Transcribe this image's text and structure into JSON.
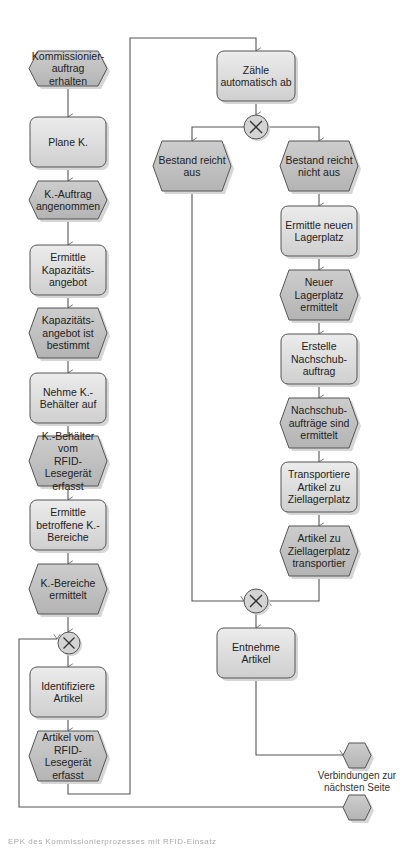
{
  "diagram": {
    "type": "EPC",
    "colors": {
      "function_fill_top": "#ececec",
      "function_fill_bottom": "#cfcfcf",
      "event_fill_top": "#cdcdcd",
      "event_fill_bottom": "#b4b4b4",
      "stroke": "#555555",
      "edge": "#555555",
      "shadow": "#d6d6d6",
      "connector_fill": "#d4d4d4"
    },
    "nodes": [
      {
        "id": "e1",
        "kind": "event",
        "label": "Kommissionier-\nauftrag erhalten",
        "x": 29,
        "y": 51,
        "w": 78,
        "h": 35
      },
      {
        "id": "f1",
        "kind": "function",
        "label": "Plane K.",
        "x": 30,
        "y": 117,
        "w": 76,
        "h": 50
      },
      {
        "id": "e2",
        "kind": "event",
        "label": "K.-Auftrag\nangenommen",
        "x": 29,
        "y": 181,
        "w": 78,
        "h": 38
      },
      {
        "id": "f2",
        "kind": "function",
        "label": "Ermittle\nKapazitäts-\nangebot",
        "x": 30,
        "y": 245,
        "w": 76,
        "h": 50
      },
      {
        "id": "e3",
        "kind": "event",
        "label": "Kapazitäts-\nangebot ist\nbestimmt",
        "x": 29,
        "y": 308,
        "w": 78,
        "h": 50
      },
      {
        "id": "f3",
        "kind": "function",
        "label": "Nehme K.-\nBehälter auf",
        "x": 30,
        "y": 373,
        "w": 76,
        "h": 50
      },
      {
        "id": "e4",
        "kind": "event",
        "label": "K.-Behälter vom\nRFID-Lesegerät\nerfasst",
        "x": 29,
        "y": 436,
        "w": 78,
        "h": 50
      },
      {
        "id": "f4",
        "kind": "function",
        "label": "Ermittle\nbetroffene K.-\nBereiche",
        "x": 30,
        "y": 500,
        "w": 76,
        "h": 50
      },
      {
        "id": "e5",
        "kind": "event",
        "label": "K.-Bereiche\nermittelt",
        "x": 29,
        "y": 564,
        "w": 78,
        "h": 50
      },
      {
        "id": "x1",
        "kind": "xor",
        "label": "XOR",
        "cx": 69,
        "cy": 643,
        "r": 11
      },
      {
        "id": "f5",
        "kind": "function",
        "label": "Identifiziere\nArtikel",
        "x": 30,
        "y": 667,
        "w": 76,
        "h": 50
      },
      {
        "id": "e6",
        "kind": "event",
        "label": "Artikel vom\nRFID-Lesegerät\nerfasst",
        "x": 29,
        "y": 731,
        "w": 78,
        "h": 50
      },
      {
        "id": "f6",
        "kind": "function",
        "label": "Zähle\nautomatisch ab",
        "x": 217,
        "y": 51,
        "w": 78,
        "h": 50
      },
      {
        "id": "x2",
        "kind": "xor",
        "label": "XOR",
        "cx": 256,
        "cy": 127,
        "r": 12
      },
      {
        "id": "e7",
        "kind": "event",
        "label": "Bestand reicht aus",
        "x": 153,
        "y": 141,
        "w": 78,
        "h": 50
      },
      {
        "id": "e8",
        "kind": "event",
        "label": "Bestand reicht\nnicht aus",
        "x": 280,
        "y": 141,
        "w": 78,
        "h": 50
      },
      {
        "id": "f7",
        "kind": "function",
        "label": "Ermittle neuen\nLagerplatz",
        "x": 281,
        "y": 206,
        "w": 76,
        "h": 50
      },
      {
        "id": "e9",
        "kind": "event",
        "label": "Neuer Lagerplatz\nermittelt",
        "x": 280,
        "y": 270,
        "w": 78,
        "h": 50
      },
      {
        "id": "f8",
        "kind": "function",
        "label": "Erstelle\nNachschub-\nauftrag",
        "x": 281,
        "y": 334,
        "w": 76,
        "h": 50
      },
      {
        "id": "e10",
        "kind": "event",
        "label": "Nachschub-\naufträge sind\nermittelt",
        "x": 280,
        "y": 398,
        "w": 78,
        "h": 50
      },
      {
        "id": "f9",
        "kind": "function",
        "label": "Transportiere\nArtikel zu\nZiellagerplatz",
        "x": 281,
        "y": 462,
        "w": 76,
        "h": 50
      },
      {
        "id": "e11",
        "kind": "event",
        "label": "Artikel zu\nZiellagerplatz\ntransportier",
        "x": 280,
        "y": 526,
        "w": 78,
        "h": 50
      },
      {
        "id": "x3",
        "kind": "xor",
        "label": "XOR",
        "cx": 256,
        "cy": 601,
        "r": 12
      },
      {
        "id": "f10",
        "kind": "function",
        "label": "Entnehme Artikel",
        "x": 217,
        "y": 628,
        "w": 78,
        "h": 50
      },
      {
        "id": "c1",
        "kind": "offpage",
        "label": "",
        "x": 343,
        "y": 743,
        "w": 28,
        "h": 25
      },
      {
        "id": "c2",
        "kind": "offpage",
        "label": "",
        "x": 343,
        "y": 795,
        "w": 28,
        "h": 25
      }
    ],
    "offpage_label": "Verbindungen zur\nnächsten Seite",
    "edges": [
      {
        "points": [
          [
            68,
            86
          ],
          [
            68,
            117
          ]
        ],
        "arrow": true
      },
      {
        "points": [
          [
            68,
            167
          ],
          [
            68,
            181
          ]
        ],
        "arrow": true
      },
      {
        "points": [
          [
            68,
            219
          ],
          [
            68,
            245
          ]
        ],
        "arrow": true
      },
      {
        "points": [
          [
            68,
            295
          ],
          [
            68,
            308
          ]
        ],
        "arrow": true
      },
      {
        "points": [
          [
            68,
            358
          ],
          [
            68,
            373
          ]
        ],
        "arrow": true
      },
      {
        "points": [
          [
            68,
            423
          ],
          [
            68,
            436
          ]
        ],
        "arrow": true
      },
      {
        "points": [
          [
            68,
            486
          ],
          [
            68,
            500
          ]
        ],
        "arrow": true
      },
      {
        "points": [
          [
            68,
            550
          ],
          [
            68,
            564
          ]
        ],
        "arrow": true
      },
      {
        "points": [
          [
            68,
            614
          ],
          [
            68,
            632
          ]
        ],
        "arrow": true
      },
      {
        "points": [
          [
            68,
            654
          ],
          [
            68,
            667
          ]
        ],
        "arrow": true
      },
      {
        "points": [
          [
            68,
            717
          ],
          [
            68,
            731
          ]
        ],
        "arrow": true
      },
      {
        "points": [
          [
            68,
            781
          ],
          [
            68,
            794
          ],
          [
            130,
            794
          ],
          [
            130,
            38
          ],
          [
            256,
            38
          ],
          [
            256,
            51
          ]
        ],
        "arrow": true
      },
      {
        "points": [
          [
            256,
            101
          ],
          [
            256,
            115
          ]
        ],
        "arrow": true
      },
      {
        "points": [
          [
            244,
            127
          ],
          [
            192,
            127
          ],
          [
            192,
            141
          ]
        ],
        "arrow": true
      },
      {
        "points": [
          [
            268,
            127
          ],
          [
            319,
            127
          ],
          [
            319,
            141
          ]
        ],
        "arrow": true
      },
      {
        "points": [
          [
            319,
            191
          ],
          [
            319,
            206
          ]
        ],
        "arrow": true
      },
      {
        "points": [
          [
            319,
            256
          ],
          [
            319,
            270
          ]
        ],
        "arrow": true
      },
      {
        "points": [
          [
            319,
            320
          ],
          [
            319,
            334
          ]
        ],
        "arrow": true
      },
      {
        "points": [
          [
            319,
            384
          ],
          [
            319,
            398
          ]
        ],
        "arrow": true
      },
      {
        "points": [
          [
            319,
            448
          ],
          [
            319,
            462
          ]
        ],
        "arrow": true
      },
      {
        "points": [
          [
            319,
            512
          ],
          [
            319,
            526
          ]
        ],
        "arrow": true
      },
      {
        "points": [
          [
            192,
            191
          ],
          [
            192,
            601
          ],
          [
            244,
            601
          ]
        ],
        "arrow": true
      },
      {
        "points": [
          [
            319,
            576
          ],
          [
            319,
            601
          ],
          [
            268,
            601
          ]
        ],
        "arrow": true
      },
      {
        "points": [
          [
            256,
            613
          ],
          [
            256,
            628
          ]
        ],
        "arrow": true
      },
      {
        "points": [
          [
            256,
            678
          ],
          [
            256,
            755
          ],
          [
            343,
            755
          ]
        ],
        "arrow": true
      },
      {
        "points": [
          [
            343,
            807
          ],
          [
            19,
            807
          ],
          [
            19,
            639
          ],
          [
            57,
            639
          ]
        ],
        "arrow": true
      }
    ]
  },
  "caption": "EPK des Kommissionierprozesses mit RFID-Einsatz"
}
